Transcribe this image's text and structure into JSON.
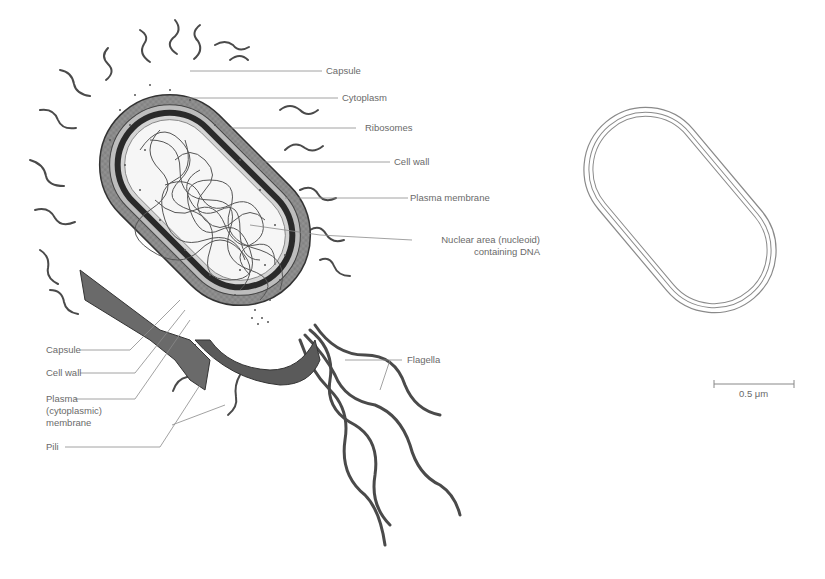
{
  "diagram": {
    "labels_right": [
      {
        "id": "capsule",
        "text": "Capsule"
      },
      {
        "id": "cytoplasm",
        "text": "Cytoplasm"
      },
      {
        "id": "ribosomes",
        "text": "Ribosomes"
      },
      {
        "id": "cell-wall",
        "text": "Cell wall"
      },
      {
        "id": "plasma-membrane",
        "text": "Plasma membrane"
      },
      {
        "id": "nucleoid-line1",
        "text": "Nuclear area (nucleoid)"
      },
      {
        "id": "nucleoid-line2",
        "text": "containing DNA"
      }
    ],
    "labels_left": [
      {
        "id": "capsule",
        "text": "Capsule"
      },
      {
        "id": "cell-wall",
        "text": "Cell wall"
      },
      {
        "id": "plasma-line1",
        "text": "Plasma"
      },
      {
        "id": "plasma-line2",
        "text": "(cytoplasmic)"
      },
      {
        "id": "plasma-line3",
        "text": "membrane"
      },
      {
        "id": "pili",
        "text": "Pili"
      }
    ],
    "flagella_label": "Flagella",
    "scale_bar": {
      "label": "0.5 μm"
    },
    "colors": {
      "capsule": "#9a9a9a",
      "wall": "#3a3a3a",
      "membrane": "#cfcfcf",
      "cytoplasm": "#f6f6f6",
      "dna": "#555555",
      "appendage": "#4a4a4a",
      "leader": "#8a8a8a"
    }
  }
}
